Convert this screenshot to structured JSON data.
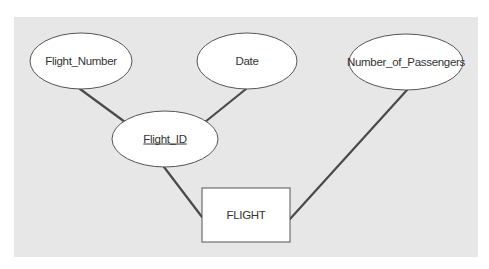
{
  "diagram": {
    "type": "entity-relationship",
    "entity": {
      "id": "flight",
      "label": "FLIGHT"
    },
    "attributes": [
      {
        "id": "flight_number",
        "label": "Flight_Number",
        "is_key": false,
        "parent": "flight_id"
      },
      {
        "id": "date",
        "label": "Date",
        "is_key": false,
        "parent": "flight_id"
      },
      {
        "id": "number_of_passengers",
        "label": "Number_of_Passengers",
        "is_key": false,
        "parent": "flight"
      },
      {
        "id": "flight_id",
        "label": "Flight_ID",
        "is_key": true,
        "parent": "flight"
      }
    ],
    "relationships": [
      {
        "from": "flight_number",
        "to": "flight_id"
      },
      {
        "from": "date",
        "to": "flight_id"
      },
      {
        "from": "flight_id",
        "to": "flight"
      },
      {
        "from": "number_of_passengers",
        "to": "flight"
      }
    ],
    "colors": {
      "panel_background": "#e7e7e7",
      "shape_fill": "#ffffff",
      "line": "#4a4a4a",
      "text": "#333333"
    }
  }
}
